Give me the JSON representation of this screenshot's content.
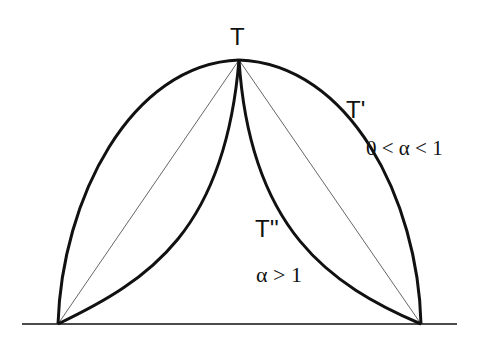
{
  "labels": {
    "apex": "T",
    "upper_curve": "T'",
    "upper_condition": "0 < α < 1",
    "lower_curve": "T''",
    "lower_condition": "α > 1"
  },
  "geometry": {
    "apex": [
      239,
      60
    ],
    "left_base": [
      58,
      324
    ],
    "right_base": [
      421,
      324
    ],
    "baseline": [
      [
        22,
        324
      ],
      [
        457,
        324
      ]
    ]
  },
  "colors": {
    "stroke": "#111111",
    "background": "#ffffff"
  }
}
